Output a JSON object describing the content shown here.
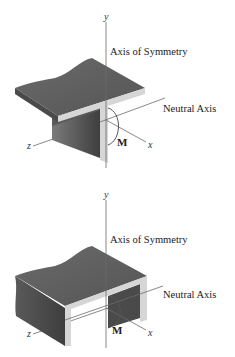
{
  "figures": [
    {
      "name": "T-beam",
      "labels": {
        "y": "y",
        "axis_of_symmetry": "Axis of Symmetry",
        "neutral_axis": "Neutral Axis",
        "z": "z",
        "x": "x",
        "moment": "M"
      }
    },
    {
      "name": "Channel beam",
      "labels": {
        "y": "y",
        "axis_of_symmetry": "Axis of Symmetry",
        "neutral_axis": "Neutral Axis",
        "z": "z",
        "x": "x",
        "moment": "M"
      }
    }
  ],
  "colors": {
    "top_surface": "#5e5e5e",
    "dark_face": "#4a4a4a",
    "cross_section": "#d6d6d6",
    "axis_line": "#6b6b6b"
  }
}
